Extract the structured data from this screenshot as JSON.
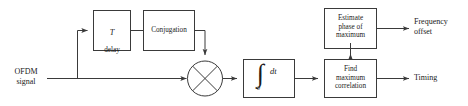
{
  "diagram": {
    "stroke_color": "#3a3a3a",
    "text_color": "#1a1a1a",
    "background": "#ffffff"
  },
  "inputs": [
    {
      "id": "ofdm_signal",
      "label": "OFDM\nsignal"
    }
  ],
  "outputs": [
    {
      "id": "frequency_offset",
      "label": "Frequency\noffset"
    },
    {
      "id": "timing",
      "label": "Timing"
    }
  ],
  "blocks": [
    {
      "id": "delay",
      "label_line1": "T",
      "label_line2": "delay",
      "label": "T\ndelay"
    },
    {
      "id": "conjugation",
      "label": "Conjugation"
    },
    {
      "id": "multiplier",
      "label": "",
      "symbol": "cross-in-circle"
    },
    {
      "id": "integrator",
      "label": "",
      "integrand": "dt",
      "lower_limit": "0",
      "symbol": "integral"
    },
    {
      "id": "find_max_correlation",
      "label": "Find\nmaximum\ncorrelation"
    },
    {
      "id": "estimate_phase",
      "label": "Estimate\nphase of\nmaximum"
    }
  ]
}
